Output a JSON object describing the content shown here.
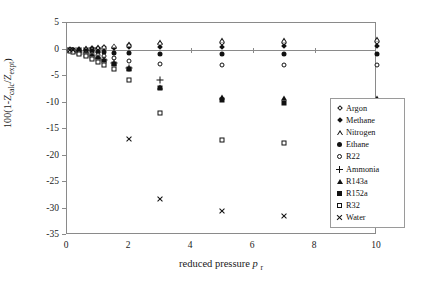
{
  "chart_data": {
    "type": "scatter",
    "title": "",
    "xlabel": "reduced pressure p r",
    "ylabel": "100(1-Z calc/Z expt)",
    "xlim": [
      0,
      10
    ],
    "ylim": [
      -35,
      5
    ],
    "xticks": [
      0,
      2,
      4,
      6,
      8,
      10
    ],
    "yticks": [
      5,
      0,
      -5,
      -10,
      -15,
      -20,
      -25,
      -30,
      -35
    ],
    "grid": false,
    "legend_position": "right-middle",
    "series": [
      {
        "name": "Argon",
        "marker": "open-diamond",
        "x": [
          0.1,
          0.2,
          0.4,
          0.6,
          0.8,
          1.0,
          1.2,
          1.5,
          2.0,
          3.0,
          5.0,
          7.0,
          10.0
        ],
        "y": [
          0.0,
          0.0,
          0.1,
          0.1,
          0.2,
          0.3,
          0.4,
          0.5,
          0.8,
          1.0,
          1.2,
          1.3,
          1.4
        ]
      },
      {
        "name": "Methane",
        "marker": "filled-diamond",
        "x": [
          0.1,
          0.2,
          0.4,
          0.6,
          0.8,
          1.0,
          1.2,
          1.5,
          2.0,
          3.0,
          5.0,
          7.0,
          10.0
        ],
        "y": [
          0.0,
          0.0,
          0.0,
          0.0,
          0.1,
          0.1,
          0.2,
          0.3,
          0.4,
          0.5,
          0.5,
          0.6,
          0.6
        ]
      },
      {
        "name": "Nitrogen",
        "marker": "open-triangle",
        "x": [
          0.1,
          0.2,
          0.4,
          0.6,
          0.8,
          1.0,
          1.2,
          1.5,
          2.0,
          3.0,
          5.0,
          7.0,
          10.0
        ],
        "y": [
          0.0,
          0.0,
          0.1,
          0.2,
          0.3,
          0.4,
          0.5,
          0.7,
          1.0,
          1.4,
          1.7,
          1.8,
          1.9
        ]
      },
      {
        "name": "Ethane",
        "marker": "filled-circle",
        "x": [
          0.1,
          0.2,
          0.4,
          0.6,
          0.8,
          1.0,
          1.2,
          1.5,
          2.0,
          3.0,
          5.0,
          7.0,
          10.0
        ],
        "y": [
          0.0,
          -0.1,
          -0.1,
          -0.2,
          -0.3,
          -0.4,
          -0.5,
          -0.6,
          -0.7,
          -0.8,
          -0.8,
          -0.8,
          -0.8
        ]
      },
      {
        "name": "R22",
        "marker": "open-circle",
        "x": [
          0.1,
          0.2,
          0.4,
          0.6,
          0.8,
          1.0,
          1.2,
          1.5,
          2.0,
          3.0,
          5.0,
          7.0,
          10.0
        ],
        "y": [
          -0.1,
          -0.2,
          -0.4,
          -0.6,
          -0.9,
          -1.1,
          -1.3,
          -1.6,
          -2.1,
          -2.7,
          -2.9,
          -3.0,
          -3.0
        ]
      },
      {
        "name": "Ammonia",
        "marker": "plus",
        "x": [
          0.1,
          0.2,
          0.4,
          0.6,
          0.8,
          1.0,
          1.2,
          1.5,
          2.0,
          3.0
        ],
        "y": [
          -0.1,
          -0.2,
          -0.5,
          -0.8,
          -1.2,
          -1.6,
          -2.0,
          -2.6,
          -3.5,
          -5.7
        ]
      },
      {
        "name": "R143a",
        "marker": "filled-triangle",
        "x": [
          0.1,
          0.2,
          0.4,
          0.6,
          0.8,
          1.0,
          1.2,
          1.5,
          2.0,
          3.0,
          5.0,
          7.0,
          10.0
        ],
        "y": [
          -0.1,
          -0.2,
          -0.5,
          -0.8,
          -1.1,
          -1.5,
          -1.9,
          -2.5,
          -3.4,
          -7.0,
          -8.9,
          -9.2,
          -9.2
        ]
      },
      {
        "name": "R152a",
        "marker": "filled-square",
        "x": [
          0.1,
          0.2,
          0.4,
          0.6,
          0.8,
          1.0,
          1.2,
          1.5,
          2.0,
          3.0,
          5.0,
          7.0,
          10.0
        ],
        "y": [
          -0.1,
          -0.3,
          -0.6,
          -1.0,
          -1.4,
          -1.8,
          -2.2,
          -2.8,
          -3.6,
          -7.3,
          -9.5,
          -10.0,
          -10.1
        ]
      },
      {
        "name": "R32",
        "marker": "open-square",
        "x": [
          0.1,
          0.2,
          0.4,
          0.6,
          0.8,
          1.0,
          1.2,
          1.5,
          2.0,
          3.0,
          5.0,
          7.0,
          10.0
        ],
        "y": [
          -0.2,
          -0.4,
          -0.8,
          -1.3,
          -1.8,
          -2.4,
          -2.9,
          -3.7,
          -5.7,
          -12.0,
          -17.1,
          -17.6,
          -17.9
        ]
      },
      {
        "name": "Water",
        "marker": "cross",
        "x": [
          0.1,
          0.2,
          0.4,
          0.6,
          0.8,
          1.0,
          2.0,
          3.0,
          5.0,
          7.0,
          10.0
        ],
        "y": [
          0.0,
          0.0,
          0.0,
          0.0,
          0.0,
          0.0,
          -16.8,
          -28.2,
          -30.5,
          -31.4,
          -24.6
        ]
      }
    ]
  },
  "axes": {
    "y_title_parts": {
      "prefix": "100(1-",
      "z1": "Z",
      "sub1": "calc",
      "slash": "/",
      "z2": "Z",
      "sub2": "expt",
      "suffix": ")"
    },
    "x_title_parts": {
      "text": "reduced pressure ",
      "symbol": "p",
      "sub": "r"
    }
  },
  "legend": {
    "entries": [
      {
        "label": "Argon",
        "marker": "open-diamond"
      },
      {
        "label": "Methane",
        "marker": "filled-diamond"
      },
      {
        "label": "Nitrogen",
        "marker": "open-triangle"
      },
      {
        "label": "Ethane",
        "marker": "filled-circle"
      },
      {
        "label": "R22",
        "marker": "open-circle"
      },
      {
        "label": "Ammonia",
        "marker": "plus"
      },
      {
        "label": "R143a",
        "marker": "filled-triangle"
      },
      {
        "label": "R152a",
        "marker": "filled-square"
      },
      {
        "label": "R32",
        "marker": "open-square"
      },
      {
        "label": "Water",
        "marker": "cross"
      }
    ]
  },
  "colors": {
    "marker": "#111111",
    "axis": "#8a8a8a",
    "background": "#ffffff"
  }
}
